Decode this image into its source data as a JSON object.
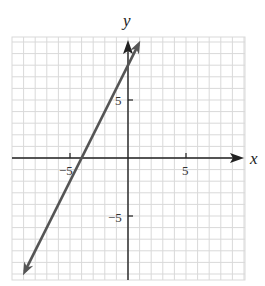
{
  "chart_data": {
    "type": "line",
    "title": "",
    "xlabel": "x",
    "ylabel": "y",
    "xlim": [
      -10,
      10
    ],
    "ylim": [
      -10,
      10
    ],
    "grid": true,
    "grid_step": 1,
    "x_ticks": [
      {
        "value": -5,
        "label": "−5"
      },
      {
        "value": 5,
        "label": "5"
      }
    ],
    "y_ticks": [
      {
        "value": 5,
        "label": "5"
      },
      {
        "value": -5,
        "label": "−5"
      }
    ],
    "series": [
      {
        "name": "line",
        "equation": "y = 2x + 8",
        "slope": 2,
        "intercept": 8,
        "x_intercept": -4,
        "points": [
          [
            -9,
            -10
          ],
          [
            -4,
            0
          ],
          [
            0,
            8
          ],
          [
            1,
            10
          ]
        ],
        "arrows_both_ends": true,
        "color": "#555555"
      }
    ],
    "legend": null
  },
  "labels": {
    "x_axis": "x",
    "y_axis": "y",
    "x_tick_neg5": "−5",
    "x_tick_5": "5",
    "y_tick_5": "5",
    "y_tick_neg5": "−5"
  },
  "colors": {
    "grid": "#d9d9d9",
    "axis": "#222222",
    "line": "#555555"
  }
}
